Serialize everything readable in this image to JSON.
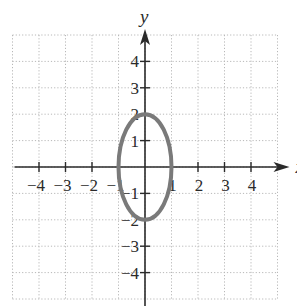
{
  "chart_data": {
    "type": "line",
    "title": "",
    "xlabel": "x",
    "ylabel": "y",
    "xlim": [
      -5,
      5
    ],
    "ylim": [
      -5,
      5
    ],
    "grid": true,
    "grid_style": "dotted",
    "x_ticks": [
      -4,
      -3,
      -2,
      -1,
      1,
      2,
      3,
      4
    ],
    "y_ticks": [
      4,
      3,
      2,
      1,
      -1,
      -2,
      -3,
      -4
    ],
    "x_tick_labels": [
      "−4",
      "−3",
      "−2",
      "−1",
      "1",
      "2",
      "3",
      "4"
    ],
    "y_tick_labels": [
      "4",
      "3",
      "2",
      "1",
      "−1",
      "−2",
      "−3",
      "−4"
    ],
    "series": [
      {
        "name": "ellipse",
        "shape": "ellipse",
        "center": [
          0,
          0
        ],
        "semi_axis_x": 1,
        "semi_axis_y": 2,
        "equation": "x^2 + y^2/4 = 1",
        "color": "#7a7a7a"
      }
    ]
  },
  "colors": {
    "axis": "#2a2a2a",
    "grid": "#b8b8b8",
    "curve": "#7a7a7a"
  }
}
